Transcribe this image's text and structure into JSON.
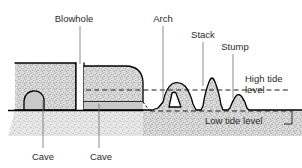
{
  "diagram": {
    "labels": {
      "blowhole": "Blowhole",
      "arch": "Arch",
      "stack": "Stack",
      "stump": "Stump",
      "cave_left": "Cave",
      "cave_right": "Cave",
      "high_tide_line1": "High tide",
      "high_tide_line2": "level",
      "low_tide": "Low tide level"
    },
    "colors": {
      "rock_outline": "#000000",
      "rock_fill": "#d8d8d8",
      "cave_fill": "#c9c9c9",
      "label_text": "#2b2b2b",
      "leader_line": "#6e6e6e",
      "tide_line": "#1a1a1a",
      "background": "#ffffff"
    },
    "features": [
      {
        "name": "Cave",
        "position": "left cliff base",
        "below_high_tide": true
      },
      {
        "name": "Blowhole",
        "position": "cliff top vertical shaft",
        "below_high_tide": false
      },
      {
        "name": "Cave",
        "position": "second cliff base",
        "below_high_tide": true
      },
      {
        "name": "Arch",
        "position": "detached headland with opening",
        "below_high_tide": false
      },
      {
        "name": "Stack",
        "position": "isolated tall pillar",
        "below_high_tide": false
      },
      {
        "name": "Stump",
        "position": "eroded remnant mound",
        "below_high_tide": false
      }
    ],
    "tide_levels": [
      {
        "name": "High tide level",
        "y": 90
      },
      {
        "name": "Low tide level",
        "y": 111
      }
    ]
  }
}
